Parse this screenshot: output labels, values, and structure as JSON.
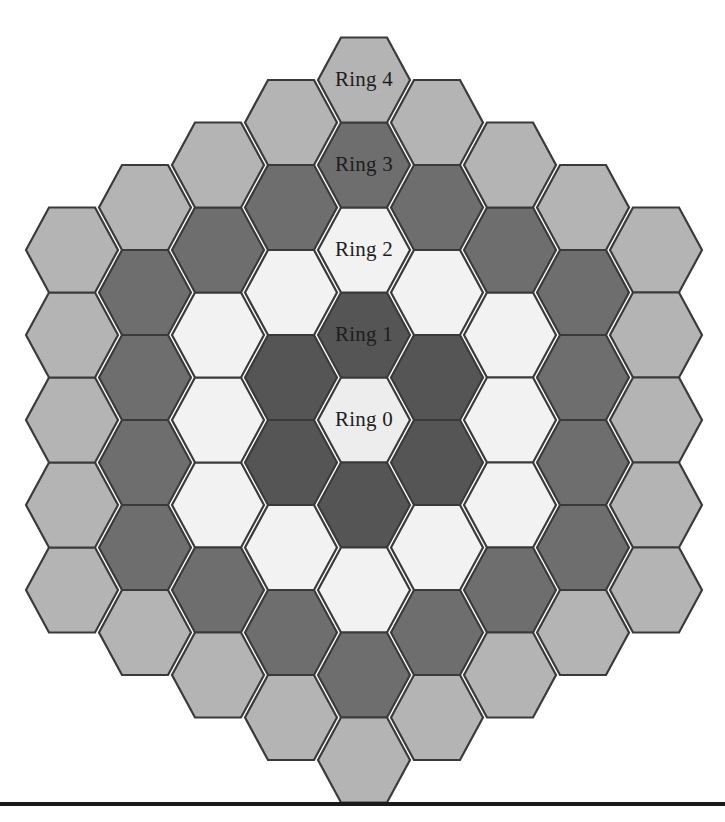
{
  "figure": {
    "name": "hexagonal-ring-grid",
    "width": 725,
    "height": 822,
    "background_color": "#ffffff",
    "hex_orientation": "flat-top",
    "hex_width": 92,
    "hex_height": 98,
    "column_spacing": 73,
    "row_spacing": 85,
    "center_x": 364,
    "center_y": 420,
    "stroke_color": "#3a3a3a",
    "stroke_width": 2.2
  },
  "rings": [
    {
      "index": 0,
      "label": "Ring 0",
      "color": "#ededed",
      "count": 1
    },
    {
      "index": 1,
      "label": "Ring 1",
      "color": "#555555",
      "count": 6
    },
    {
      "index": 2,
      "label": "Ring 2",
      "color": "#f2f2f2",
      "count": 12
    },
    {
      "index": 3,
      "label": "Ring 3",
      "color": "#6e6e6e",
      "count": 18
    },
    {
      "index": 4,
      "label": "Ring 4",
      "color": "#b4b4b4",
      "count": 24
    }
  ],
  "labels": [
    {
      "text": "Ring 0",
      "x": 364,
      "y": 420,
      "ring": 0
    },
    {
      "text": "Ring 1",
      "x": 364,
      "y": 335,
      "ring": 1
    },
    {
      "text": "Ring 2",
      "x": 364,
      "y": 250,
      "ring": 2
    },
    {
      "text": "Ring 3",
      "x": 364,
      "y": 165,
      "ring": 3
    },
    {
      "text": "Ring 4",
      "x": 364,
      "y": 80,
      "ring": 4
    }
  ],
  "baseline_rule": {
    "x": 0,
    "y": 802,
    "width": 725,
    "height": 4,
    "color": "#1a1a1a"
  },
  "chart_data": {
    "type": "heatmap",
    "title": "",
    "categories": [
      "Ring 0",
      "Ring 1",
      "Ring 2",
      "Ring 3",
      "Ring 4"
    ],
    "values": [
      1,
      6,
      12,
      18,
      24
    ],
    "colors": [
      "#ededed",
      "#555555",
      "#f2f2f2",
      "#6e6e6e",
      "#b4b4b4"
    ],
    "xlabel": "",
    "ylabel": "",
    "legend": "none",
    "grid": false,
    "cells": [
      {
        "q": 0,
        "r": 0,
        "ring": 0
      },
      {
        "q": 1,
        "r": -1,
        "ring": 1
      },
      {
        "q": 1,
        "r": 0,
        "ring": 1
      },
      {
        "q": 0,
        "r": 1,
        "ring": 1
      },
      {
        "q": -1,
        "r": 1,
        "ring": 1
      },
      {
        "q": -1,
        "r": 0,
        "ring": 1
      },
      {
        "q": 0,
        "r": -1,
        "ring": 1
      },
      {
        "q": 2,
        "r": -2,
        "ring": 2
      },
      {
        "q": 2,
        "r": -1,
        "ring": 2
      },
      {
        "q": 2,
        "r": 0,
        "ring": 2
      },
      {
        "q": 1,
        "r": 1,
        "ring": 2
      },
      {
        "q": 0,
        "r": 2,
        "ring": 2
      },
      {
        "q": -1,
        "r": 2,
        "ring": 2
      },
      {
        "q": -2,
        "r": 2,
        "ring": 2
      },
      {
        "q": -2,
        "r": 1,
        "ring": 2
      },
      {
        "q": -2,
        "r": 0,
        "ring": 2
      },
      {
        "q": -1,
        "r": -1,
        "ring": 2
      },
      {
        "q": 0,
        "r": -2,
        "ring": 2
      },
      {
        "q": 1,
        "r": -2,
        "ring": 2
      },
      {
        "q": 3,
        "r": -3,
        "ring": 3
      },
      {
        "q": 3,
        "r": -2,
        "ring": 3
      },
      {
        "q": 3,
        "r": -1,
        "ring": 3
      },
      {
        "q": 3,
        "r": 0,
        "ring": 3
      },
      {
        "q": 2,
        "r": 1,
        "ring": 3
      },
      {
        "q": 1,
        "r": 2,
        "ring": 3
      },
      {
        "q": 0,
        "r": 3,
        "ring": 3
      },
      {
        "q": -1,
        "r": 3,
        "ring": 3
      },
      {
        "q": -2,
        "r": 3,
        "ring": 3
      },
      {
        "q": -3,
        "r": 3,
        "ring": 3
      },
      {
        "q": -3,
        "r": 2,
        "ring": 3
      },
      {
        "q": -3,
        "r": 1,
        "ring": 3
      },
      {
        "q": -3,
        "r": 0,
        "ring": 3
      },
      {
        "q": -2,
        "r": -1,
        "ring": 3
      },
      {
        "q": -1,
        "r": -2,
        "ring": 3
      },
      {
        "q": 0,
        "r": -3,
        "ring": 3
      },
      {
        "q": 1,
        "r": -3,
        "ring": 3
      },
      {
        "q": 2,
        "r": -3,
        "ring": 3
      },
      {
        "q": 4,
        "r": -4,
        "ring": 4
      },
      {
        "q": 4,
        "r": -3,
        "ring": 4
      },
      {
        "q": 4,
        "r": -2,
        "ring": 4
      },
      {
        "q": 4,
        "r": -1,
        "ring": 4
      },
      {
        "q": 4,
        "r": 0,
        "ring": 4
      },
      {
        "q": 3,
        "r": 1,
        "ring": 4
      },
      {
        "q": 2,
        "r": 2,
        "ring": 4
      },
      {
        "q": 1,
        "r": 3,
        "ring": 4
      },
      {
        "q": 0,
        "r": 4,
        "ring": 4
      },
      {
        "q": -1,
        "r": 4,
        "ring": 4
      },
      {
        "q": -2,
        "r": 4,
        "ring": 4
      },
      {
        "q": -3,
        "r": 4,
        "ring": 4
      },
      {
        "q": -4,
        "r": 4,
        "ring": 4
      },
      {
        "q": -4,
        "r": 3,
        "ring": 4
      },
      {
        "q": -4,
        "r": 2,
        "ring": 4
      },
      {
        "q": -4,
        "r": 1,
        "ring": 4
      },
      {
        "q": -4,
        "r": 0,
        "ring": 4
      },
      {
        "q": -3,
        "r": -1,
        "ring": 4
      },
      {
        "q": -2,
        "r": -2,
        "ring": 4
      },
      {
        "q": -1,
        "r": -3,
        "ring": 4
      },
      {
        "q": 0,
        "r": -4,
        "ring": 4
      },
      {
        "q": 1,
        "r": -4,
        "ring": 4
      },
      {
        "q": 2,
        "r": -4,
        "ring": 4
      },
      {
        "q": 3,
        "r": -4,
        "ring": 4
      }
    ]
  }
}
